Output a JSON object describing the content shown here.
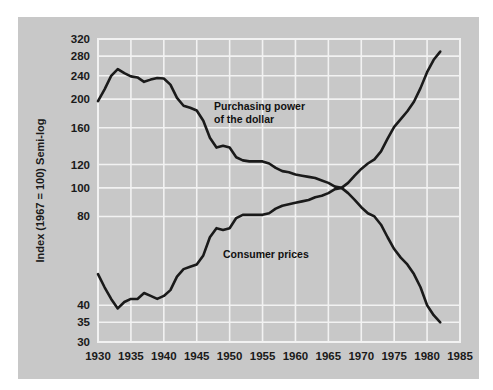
{
  "chart_data": {
    "type": "line",
    "title": "",
    "subtitle": "",
    "xlabel": "",
    "ylabel": "Index (1967 = 100) Semi-log",
    "scale": "semi-log",
    "grid": true,
    "legend_position": "inline-annotations",
    "xlim": [
      1930,
      1985
    ],
    "ylim": [
      30,
      320
    ],
    "xticks": [
      1930,
      1935,
      1940,
      1945,
      1950,
      1955,
      1960,
      1965,
      1970,
      1975,
      1980,
      1985
    ],
    "xticklabels": [
      "1930",
      "1935",
      "1940",
      "1945",
      "1950",
      "1955",
      "1960",
      "1965",
      "1970",
      "1975",
      "1980",
      "1985"
    ],
    "yticks": [
      30,
      35,
      40,
      80,
      100,
      120,
      160,
      200,
      240,
      280,
      320
    ],
    "yticklabels": [
      "30",
      "35",
      "40",
      "80",
      "100",
      "120",
      "160",
      "200",
      "240",
      "280",
      "320"
    ],
    "y_gridlines": [
      35,
      40,
      80,
      100,
      120,
      160,
      200,
      240,
      280,
      320
    ],
    "series": [
      {
        "name": "Purchasing power of the dollar",
        "annotation": "Purchasing power\nof the dollar",
        "annotation_line1": "Purchasing power",
        "annotation_line2": "of the dollar",
        "color": "#1a1a1a",
        "x": [
          1930,
          1931,
          1932,
          1933,
          1934,
          1935,
          1936,
          1937,
          1938,
          1939,
          1940,
          1941,
          1942,
          1943,
          1944,
          1945,
          1946,
          1947,
          1948,
          1949,
          1950,
          1951,
          1952,
          1953,
          1954,
          1955,
          1956,
          1957,
          1958,
          1959,
          1960,
          1961,
          1962,
          1963,
          1964,
          1965,
          1966,
          1967,
          1968,
          1969,
          1970,
          1971,
          1972,
          1973,
          1974,
          1975,
          1976,
          1977,
          1978,
          1979,
          1980,
          1981,
          1982
        ],
        "values": [
          197,
          216,
          240,
          253,
          245,
          239,
          237,
          229,
          233,
          236,
          235,
          224,
          202,
          190,
          187,
          183,
          169,
          148,
          137,
          139,
          137,
          127,
          124,
          123,
          123,
          123,
          121,
          117,
          114,
          113,
          111,
          110,
          109,
          108,
          106,
          104,
          101,
          100,
          96,
          91,
          86,
          82,
          80,
          75,
          68,
          62,
          58,
          55,
          51,
          46,
          40,
          37,
          35
        ]
      },
      {
        "name": "Consumer prices",
        "annotation": "Consumer prices",
        "color": "#1a1a1a",
        "x": [
          1930,
          1931,
          1932,
          1933,
          1934,
          1935,
          1936,
          1937,
          1938,
          1939,
          1940,
          1941,
          1942,
          1943,
          1944,
          1945,
          1946,
          1947,
          1948,
          1949,
          1950,
          1951,
          1952,
          1953,
          1954,
          1955,
          1956,
          1957,
          1958,
          1959,
          1960,
          1961,
          1962,
          1963,
          1964,
          1965,
          1966,
          1967,
          1968,
          1969,
          1970,
          1971,
          1972,
          1973,
          1974,
          1975,
          1976,
          1977,
          1978,
          1979,
          1980,
          1981,
          1982
        ],
        "values": [
          51,
          46,
          42,
          39,
          41,
          42,
          42,
          44,
          43,
          42,
          43,
          45,
          50,
          53,
          54,
          55,
          59,
          68,
          73,
          72,
          73,
          79,
          81,
          81,
          81,
          81,
          82,
          85,
          87,
          88,
          89,
          90,
          91,
          93,
          94,
          96,
          99,
          100,
          104,
          110,
          116,
          121,
          125,
          133,
          147,
          161,
          171,
          182,
          196,
          218,
          247,
          272,
          290
        ]
      }
    ]
  },
  "style": {
    "panel_background": "#c8c8c8",
    "figure_background": "#ffffff",
    "grid_color": "#f2f2f2",
    "line_color": "#1a1a1a",
    "text_color": "#1a1a1a"
  }
}
